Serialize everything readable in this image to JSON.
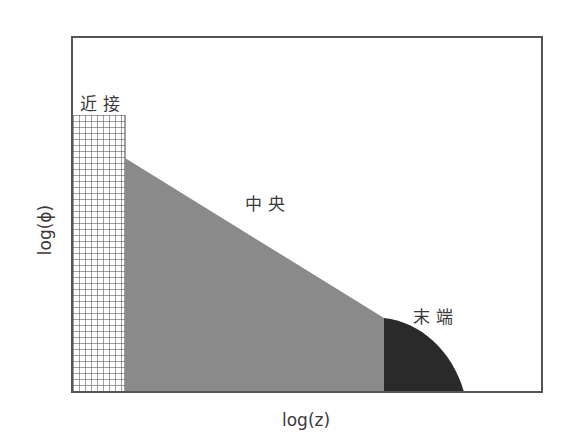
{
  "diagram": {
    "regions": [
      {
        "id": "near",
        "label": "近接",
        "fill": "crosshatch-grid"
      },
      {
        "id": "middle",
        "label": "中央",
        "fill": "#8a8a8a"
      },
      {
        "id": "end",
        "label": "末端",
        "fill": "#2a2a2a"
      }
    ],
    "x_axis_label": "log(z)",
    "y_axis_label": "log(ϕ)",
    "colors": {
      "frame": "#555555",
      "grid_line": "#444444",
      "middle_fill": "#8a8a8a",
      "end_fill": "#2a2a2a"
    }
  }
}
